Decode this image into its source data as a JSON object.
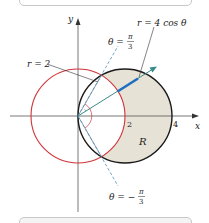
{
  "figure": {
    "axes": {
      "x_label": "x",
      "y_label": "y",
      "tick_2": "2",
      "tick_4": "4"
    },
    "curves": {
      "circle_r2_label": "r = 2",
      "circle_4cos_label": "r = 4 cos θ"
    },
    "rays": {
      "upper_theta_lhs": "θ =",
      "upper_theta_num": "π",
      "upper_theta_den": "3",
      "lower_theta_lhs": "θ = −",
      "lower_theta_num": "π",
      "lower_theta_den": "3"
    },
    "region_label": "R",
    "colors": {
      "red_circle": "#d0343a",
      "black_circle": "#1a1a1a",
      "shaded_region": "#e6e2d6",
      "ray_blue": "#1f6fc0",
      "arrow_teal": "#3a8a8a",
      "dashed_ray": "#4a90c0",
      "axis": "#555555"
    }
  }
}
